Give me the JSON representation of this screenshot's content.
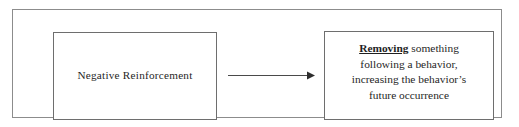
{
  "diagram": {
    "type": "flow-diagram",
    "background_color": "#ffffff",
    "frame_border_color": "#8c8c8c",
    "box_border_color": "#6e6e6e",
    "text_color": "#262626",
    "nodes": [
      {
        "id": "source",
        "label": "Negative Reinforcement"
      },
      {
        "id": "definition",
        "emphasis": "Removing",
        "line1_rest": " something",
        "line2": "following a behavior,",
        "line3": "increasing the behavior’s",
        "line4": "future occurrence"
      }
    ],
    "connector": {
      "name": "arrow-right",
      "from": "source",
      "to": "definition",
      "color": "#4a4a4a"
    }
  }
}
